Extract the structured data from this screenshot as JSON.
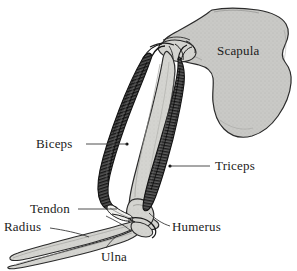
{
  "figure": {
    "kind": "anatomical-diagram",
    "background_color": "#ffffff",
    "width": 297,
    "height": 271
  },
  "colors": {
    "background": "#ffffff",
    "bone_fill": "#c9c9c6",
    "bone_fill_light": "#d5d5d1",
    "bone_outline": "#2b2b2b",
    "muscle_dark": "#4a4a4a",
    "muscle_darker": "#272727",
    "tendon_fill": "#f2f2ef",
    "label_text": "#1b1b1b",
    "leader_line": "#3a3a3a"
  },
  "labels": [
    {
      "id": "scapula",
      "text": "Scapula",
      "structure_type": "bone",
      "has_leader_line": false,
      "position": {
        "x": 217,
        "y": 44
      }
    },
    {
      "id": "biceps",
      "text": "Biceps",
      "structure_type": "muscle",
      "has_leader_line": true,
      "position": {
        "x": 36,
        "y": 137
      },
      "leader_line": {
        "x1": 86,
        "y1": 144,
        "x2": 127,
        "y2": 144
      }
    },
    {
      "id": "triceps",
      "text": "Triceps",
      "structure_type": "muscle",
      "has_leader_line": true,
      "position": {
        "x": 215,
        "y": 159
      },
      "leader_line": {
        "x1": 210,
        "y1": 166,
        "x2": 170,
        "y2": 166
      }
    },
    {
      "id": "tendon",
      "text": "Tendon",
      "structure_type": "connective-tissue",
      "has_leader_line": true,
      "position": {
        "x": 30,
        "y": 202
      },
      "leader_line": {
        "x1": 78,
        "y1": 209,
        "x2": 117,
        "y2": 209
      }
    },
    {
      "id": "radius",
      "text": "Radius",
      "structure_type": "bone",
      "has_leader_line": true,
      "position": {
        "x": 4,
        "y": 220
      },
      "leader_line": {
        "x1": 50,
        "y1": 228,
        "x2": 88,
        "y2": 236
      }
    },
    {
      "id": "humerus",
      "text": "Humerus",
      "structure_type": "bone",
      "has_leader_line": true,
      "position": {
        "x": 172,
        "y": 220
      },
      "leader_line": {
        "x1": 170,
        "y1": 226,
        "x2": 150,
        "y2": 214
      }
    },
    {
      "id": "ulna",
      "text": "Ulna",
      "structure_type": "bone",
      "has_leader_line": true,
      "position": {
        "x": 101,
        "y": 250
      },
      "leader_line": {
        "x1": 106,
        "y1": 248,
        "x2": 116,
        "y2": 237
      }
    }
  ],
  "structures": [
    {
      "id": "scapula",
      "name": "Scapula",
      "type": "bone",
      "shade": "light-gray-stippled"
    },
    {
      "id": "humerus",
      "name": "Humerus",
      "type": "bone",
      "shade": "light-gray-stippled"
    },
    {
      "id": "radius",
      "name": "Radius",
      "type": "bone",
      "shade": "light-gray-stippled"
    },
    {
      "id": "ulna",
      "name": "Ulna",
      "type": "bone",
      "shade": "light-gray-stippled"
    },
    {
      "id": "biceps",
      "name": "Biceps",
      "type": "muscle",
      "shade": "dark-hatched"
    },
    {
      "id": "triceps",
      "name": "Triceps",
      "type": "muscle",
      "shade": "dark-hatched"
    },
    {
      "id": "tendon",
      "name": "Tendon",
      "type": "connective-tissue",
      "shade": "pale"
    }
  ]
}
